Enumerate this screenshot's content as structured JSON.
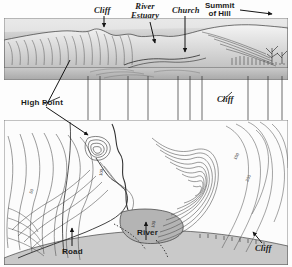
{
  "figure": {
    "background_color": "#fdfdfd",
    "ink_color": "#1b1b1b",
    "water_fill": "#b4b4b4",
    "land_shade": "#d8d8d8"
  },
  "panorama": {
    "name": "perspective-sketch-of-coastal-hills",
    "labels": [
      {
        "id": "cliff-top",
        "text": "Cliff",
        "style": "serif-italic"
      },
      {
        "id": "estuary",
        "text": "River\nEstuary",
        "style": "serif-italic"
      },
      {
        "id": "church",
        "text": "Church",
        "style": "serif-italic"
      },
      {
        "id": "summit",
        "text": "Summit\nof Hill",
        "style": "sans-bold"
      }
    ]
  },
  "middle": {
    "labels": [
      {
        "id": "high-point",
        "text": "High Point",
        "style": "sans-bold"
      },
      {
        "id": "cliff-mid",
        "text": "Cliff",
        "style": "serif-italic"
      }
    ]
  },
  "mapview": {
    "name": "contour-map",
    "labels": [
      {
        "id": "road",
        "text": "Road",
        "style": "sans-bold"
      },
      {
        "id": "river",
        "text": "River",
        "style": "sans-bold"
      },
      {
        "id": "cliff-bot",
        "text": "Cliff",
        "style": "serif-italic"
      }
    ],
    "contour_values": [
      "50",
      "100",
      "150",
      "200"
    ]
  },
  "connectors": {
    "name": "correspondence-lines",
    "x_positions": [
      88,
      100,
      128,
      148,
      178,
      190,
      202,
      248,
      268,
      282
    ]
  }
}
